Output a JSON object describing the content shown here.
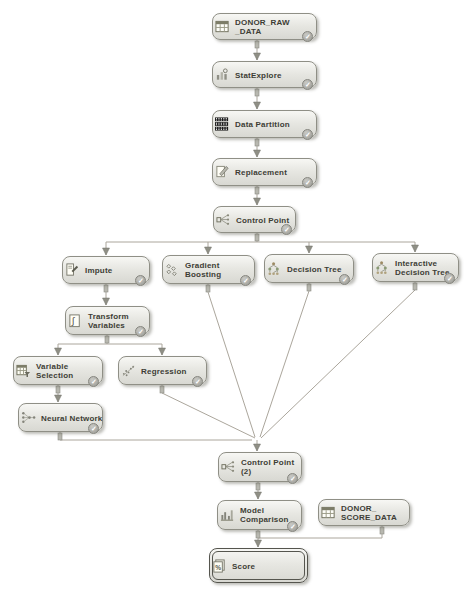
{
  "diagram": {
    "colors": {
      "background": "#ffffff",
      "node_fill_top": "#f7f7f4",
      "node_fill_bottom": "#d8d8d2",
      "node_border": "#8f8f86",
      "node_text": "#3d3d35",
      "edge_line": "#aba69c",
      "arrowhead": "#8f8f85",
      "check_badge": "#9b9b95"
    },
    "status_check_glyph": "✓",
    "nodes": [
      {
        "id": "donor-raw-data",
        "label": [
          "DONOR_RAW",
          "_DATA"
        ],
        "icon": "table",
        "x": 212,
        "y": 13,
        "w": 105,
        "h": 27,
        "check": true,
        "selected": false
      },
      {
        "id": "statexplore",
        "label": [
          "StatExplore"
        ],
        "icon": "explore",
        "x": 212,
        "y": 61,
        "w": 105,
        "h": 27,
        "check": true,
        "selected": false
      },
      {
        "id": "data-partition",
        "label": [
          "Data Partition"
        ],
        "icon": "partition",
        "x": 212,
        "y": 110,
        "w": 105,
        "h": 28,
        "check": true,
        "selected": false
      },
      {
        "id": "replacement",
        "label": [
          "Replacement"
        ],
        "icon": "replacement",
        "x": 212,
        "y": 158,
        "w": 105,
        "h": 28,
        "check": true,
        "selected": false
      },
      {
        "id": "control-point",
        "label": [
          "Control Point"
        ],
        "icon": "control",
        "x": 213,
        "y": 206,
        "w": 83,
        "h": 27,
        "check": true,
        "selected": false
      },
      {
        "id": "impute",
        "label": [
          "Impute"
        ],
        "icon": "impute",
        "x": 62,
        "y": 256,
        "w": 88,
        "h": 28,
        "check": true,
        "selected": false
      },
      {
        "id": "gradient-boosting",
        "label": [
          "Gradient",
          "Boosting"
        ],
        "icon": "boosting",
        "x": 162,
        "y": 255,
        "w": 93,
        "h": 29,
        "check": true,
        "selected": false
      },
      {
        "id": "decision-tree",
        "label": [
          "Decision Tree"
        ],
        "icon": "tree",
        "x": 264,
        "y": 254,
        "w": 90,
        "h": 29,
        "check": true,
        "selected": false
      },
      {
        "id": "interactive-decision-tree",
        "label": [
          "Interactive",
          "Decision Tree"
        ],
        "icon": "tree",
        "x": 372,
        "y": 253,
        "w": 87,
        "h": 29,
        "check": true,
        "selected": false
      },
      {
        "id": "transform-variables",
        "label": [
          "Transform",
          "Variables"
        ],
        "icon": "transform",
        "x": 65,
        "y": 306,
        "w": 85,
        "h": 29,
        "check": true,
        "selected": false
      },
      {
        "id": "variable-selection",
        "label": [
          "Variable",
          "Selection"
        ],
        "icon": "varsel",
        "x": 13,
        "y": 356,
        "w": 90,
        "h": 29,
        "check": true,
        "selected": false
      },
      {
        "id": "regression",
        "label": [
          "Regression"
        ],
        "icon": "regression",
        "x": 118,
        "y": 356,
        "w": 89,
        "h": 29,
        "check": true,
        "selected": false
      },
      {
        "id": "neural-network",
        "label": [
          "Neural Network"
        ],
        "icon": "neural",
        "x": 18,
        "y": 403,
        "w": 85,
        "h": 29,
        "check": true,
        "selected": false
      },
      {
        "id": "control-point-2",
        "label": [
          "Control Point",
          "(2)"
        ],
        "icon": "control",
        "x": 218,
        "y": 452,
        "w": 84,
        "h": 30,
        "check": true,
        "selected": false
      },
      {
        "id": "model-comparison",
        "label": [
          "Model",
          "Comparison"
        ],
        "icon": "comparison",
        "x": 217,
        "y": 500,
        "w": 85,
        "h": 30,
        "check": true,
        "selected": false
      },
      {
        "id": "donor-score-data",
        "label": [
          "DONOR_",
          "SCORE_DATA"
        ],
        "icon": "table",
        "x": 318,
        "y": 499,
        "w": 92,
        "h": 27,
        "check": false,
        "selected": false
      },
      {
        "id": "score",
        "label": [
          "Score"
        ],
        "icon": "score",
        "x": 209,
        "y": 548,
        "w": 99,
        "h": 35,
        "check": false,
        "selected": true
      }
    ],
    "edges": [
      {
        "points": [
          [
            257,
            40
          ],
          [
            257,
            60
          ]
        ],
        "arrow": true
      },
      {
        "points": [
          [
            257,
            88
          ],
          [
            257,
            109
          ]
        ],
        "arrow": true
      },
      {
        "points": [
          [
            257,
            138
          ],
          [
            257,
            157
          ]
        ],
        "arrow": true
      },
      {
        "points": [
          [
            257,
            186
          ],
          [
            257,
            205
          ]
        ],
        "arrow": true
      },
      {
        "points": [
          [
            257,
            233
          ],
          [
            257,
            242
          ]
        ],
        "arrow": false
      },
      {
        "points": [
          [
            106,
            242
          ],
          [
            415,
            242
          ]
        ],
        "arrow": false
      },
      {
        "points": [
          [
            106,
            242
          ],
          [
            106,
            255
          ]
        ],
        "arrow": true
      },
      {
        "points": [
          [
            208,
            242
          ],
          [
            208,
            254
          ]
        ],
        "arrow": true
      },
      {
        "points": [
          [
            309,
            242
          ],
          [
            309,
            253
          ]
        ],
        "arrow": true
      },
      {
        "points": [
          [
            415,
            242
          ],
          [
            415,
            252
          ]
        ],
        "arrow": true
      },
      {
        "points": [
          [
            106,
            284
          ],
          [
            106,
            305
          ]
        ],
        "arrow": true
      },
      {
        "points": [
          [
            107,
            335
          ],
          [
            107,
            344
          ]
        ],
        "arrow": false
      },
      {
        "points": [
          [
            58,
            344
          ],
          [
            162,
            344
          ]
        ],
        "arrow": false
      },
      {
        "points": [
          [
            58,
            344
          ],
          [
            58,
            355
          ]
        ],
        "arrow": true
      },
      {
        "points": [
          [
            162,
            344
          ],
          [
            162,
            355
          ]
        ],
        "arrow": true
      },
      {
        "points": [
          [
            58,
            385
          ],
          [
            58,
            402
          ]
        ],
        "arrow": true
      },
      {
        "points": [
          [
            60,
            432
          ],
          [
            60,
            440
          ],
          [
            252,
            440
          ]
        ],
        "arrow": false
      },
      {
        "points": [
          [
            162,
            385
          ],
          [
            162,
            393
          ],
          [
            255,
            438
          ]
        ],
        "arrow": false
      },
      {
        "points": [
          [
            208,
            284
          ],
          [
            208,
            292
          ],
          [
            255,
            437
          ]
        ],
        "arrow": false
      },
      {
        "points": [
          [
            309,
            283
          ],
          [
            309,
            291
          ],
          [
            260,
            437
          ]
        ],
        "arrow": false
      },
      {
        "points": [
          [
            415,
            282
          ],
          [
            415,
            290
          ],
          [
            261,
            438
          ]
        ],
        "arrow": false
      },
      {
        "points": [
          [
            257,
            440
          ],
          [
            257,
            451
          ]
        ],
        "arrow": true
      },
      {
        "points": [
          [
            258,
            482
          ],
          [
            258,
            499
          ]
        ],
        "arrow": true
      },
      {
        "points": [
          [
            258,
            530
          ],
          [
            258,
            538
          ]
        ],
        "arrow": false
      },
      {
        "points": [
          [
            382,
            526
          ],
          [
            382,
            538
          ],
          [
            258,
            538
          ]
        ],
        "arrow": false
      },
      {
        "points": [
          [
            258,
            538
          ],
          [
            258,
            547
          ]
        ],
        "arrow": true
      }
    ],
    "stubs": [
      [
        257,
        41
      ],
      [
        257,
        89
      ],
      [
        257,
        139
      ],
      [
        257,
        187
      ],
      [
        257,
        234
      ],
      [
        106,
        285
      ],
      [
        107,
        336
      ],
      [
        58,
        386
      ],
      [
        60,
        433
      ],
      [
        162,
        386
      ],
      [
        208,
        285
      ],
      [
        309,
        284
      ],
      [
        415,
        283
      ],
      [
        258,
        483
      ],
      [
        258,
        531
      ],
      [
        382,
        527
      ]
    ]
  }
}
